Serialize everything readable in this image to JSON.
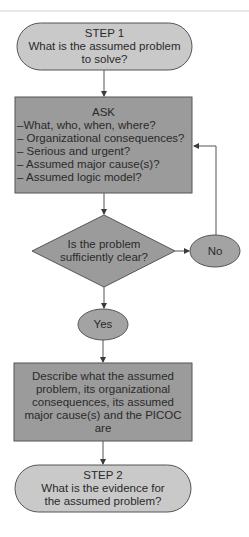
{
  "colors": {
    "terminal_fill": "#c9c9c9",
    "process_fill": "#9b9b9b",
    "decision_fill": "#9b9b9b",
    "ellipse_fill": "#a3a3a3",
    "stroke": "#555555",
    "text": "#2a2a2a"
  },
  "flowchart": {
    "step1": {
      "heading": "STEP 1",
      "line1": "What is the assumed problem",
      "line2": "to solve?"
    },
    "ask": {
      "heading": "ASK",
      "items": [
        "–What, who, when, where?",
        "– Organizational consequences?",
        "– Serious and urgent?",
        "– Assumed major cause(s)?",
        "– Assumed logic model?"
      ]
    },
    "decision": {
      "line1": "Is the problem",
      "line2": "sufficiently clear?"
    },
    "no_label": "No",
    "yes_label": "Yes",
    "describe": {
      "lines": [
        "Describe what the assumed",
        "problem, its organizational",
        "consequences, its assumed",
        "major cause(s) and the PICOC",
        "are"
      ]
    },
    "step2": {
      "heading": "STEP 2",
      "line1": "What is the evidence for",
      "line2": "the assumed problem?"
    }
  }
}
